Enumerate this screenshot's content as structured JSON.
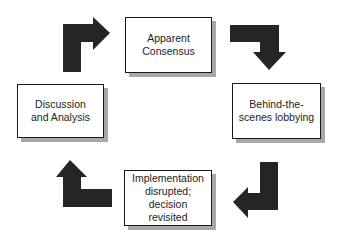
{
  "diagram": {
    "type": "cycle",
    "direction": "clockwise",
    "arrow_color": "#252525",
    "nodes": [
      {
        "id": "apparent-consensus",
        "label": "Apparent\nConsensus"
      },
      {
        "id": "behind-the-scenes-lobbying",
        "label": "Behind-the-\nscenes lobbying"
      },
      {
        "id": "implementation-disrupted",
        "label": "Implementation\ndisrupted; decision\nrevisited"
      },
      {
        "id": "discussion-and-analysis",
        "label": "Discussion\nand Analysis"
      }
    ],
    "edges": [
      {
        "from": "apparent-consensus",
        "to": "behind-the-scenes-lobbying"
      },
      {
        "from": "behind-the-scenes-lobbying",
        "to": "implementation-disrupted"
      },
      {
        "from": "implementation-disrupted",
        "to": "discussion-and-analysis"
      },
      {
        "from": "discussion-and-analysis",
        "to": "apparent-consensus"
      }
    ]
  }
}
